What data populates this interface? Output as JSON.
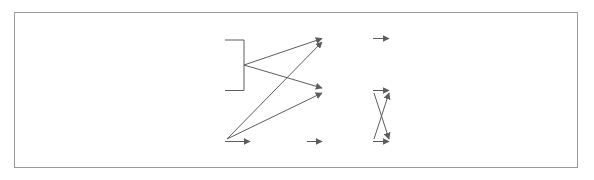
{
  "diagram": {
    "frame": {
      "visible": true,
      "color": "#9a9a9a"
    },
    "nodes": [
      {
        "id": "lipid",
        "name": "node-fatty-acid-glycerol",
        "lines": [
          "지방산",
          "글리세롤"
        ],
        "x": 167,
        "y": 25,
        "w": 58,
        "h": 30,
        "style": "k-sm"
      },
      {
        "id": "glucose",
        "name": "node-glucose",
        "lines": [
          "포도당"
        ],
        "x": 167,
        "y": 80,
        "w": 58,
        "h": 21,
        "style": "k-md"
      },
      {
        "id": "amino",
        "name": "node-amino-acid",
        "lines": [
          "아미노산"
        ],
        "x": 167,
        "y": 131,
        "w": 58,
        "h": 21,
        "style": "k-md"
      },
      {
        "id": "ammonia",
        "name": "node-ammonia",
        "lines": [
          "암모니아"
        ],
        "x": 253,
        "y": 131,
        "w": 54,
        "h": 21,
        "style": "k-md"
      },
      {
        "id": "A",
        "name": "node-a",
        "lines": [
          "A"
        ],
        "x": 325,
        "y": 28,
        "w": 48,
        "h": 21,
        "style": "lat"
      },
      {
        "id": "B",
        "name": "node-b",
        "lines": [
          "B"
        ],
        "x": 325,
        "y": 80,
        "w": 48,
        "h": 21,
        "style": "lat"
      },
      {
        "id": "C",
        "name": "node-c",
        "lines": [
          "C"
        ],
        "x": 325,
        "y": 131,
        "w": 48,
        "h": 21,
        "style": "lat"
      },
      {
        "id": "lung",
        "name": "node-lung",
        "lines": [
          "폐"
        ],
        "x": 392,
        "y": 28,
        "w": 44,
        "h": 21,
        "style": "k-md"
      },
      {
        "id": "skin",
        "name": "node-skin",
        "lines": [
          "피부"
        ],
        "x": 392,
        "y": 80,
        "w": 44,
        "h": 21,
        "style": "k-md"
      },
      {
        "id": "kidney",
        "name": "node-kidney",
        "lines": [
          "콩팥"
        ],
        "x": 392,
        "y": 131,
        "w": 44,
        "h": 21,
        "style": "k-md"
      }
    ],
    "edges": [
      {
        "name": "edge-lipid-to-junction",
        "from": "lipid",
        "to": "junction",
        "arrow": false
      },
      {
        "name": "edge-glucose-to-junction",
        "from": "glucose",
        "to": "junction",
        "arrow": false
      },
      {
        "name": "edge-junction-to-a",
        "from": "junction",
        "to": "A",
        "arrow": true
      },
      {
        "name": "edge-junction-to-b",
        "from": "junction",
        "to": "B",
        "arrow": true
      },
      {
        "name": "edge-amino-to-a",
        "from": "amino",
        "to": "A",
        "arrow": true
      },
      {
        "name": "edge-amino-to-b",
        "from": "amino",
        "to": "B",
        "arrow": true
      },
      {
        "name": "edge-amino-to-ammonia",
        "from": "amino",
        "to": "ammonia",
        "arrow": true
      },
      {
        "name": "edge-ammonia-to-c",
        "from": "ammonia",
        "to": "C",
        "arrow": true
      },
      {
        "name": "edge-a-to-lung",
        "from": "A",
        "to": "lung",
        "arrow": true
      },
      {
        "name": "edge-b-to-skin",
        "from": "B",
        "to": "skin",
        "arrow": true
      },
      {
        "name": "edge-b-to-kidney",
        "from": "B",
        "to": "kidney",
        "arrow": true
      },
      {
        "name": "edge-c-to-skin",
        "from": "C",
        "to": "skin",
        "arrow": true
      },
      {
        "name": "edge-c-to-kidney",
        "from": "C",
        "to": "kidney",
        "arrow": true
      }
    ],
    "line_color": "#5d5d5d"
  }
}
